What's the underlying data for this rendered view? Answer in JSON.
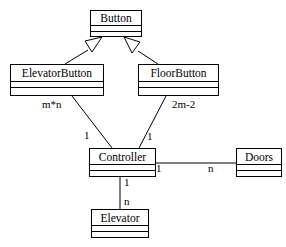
{
  "diagram": {
    "type": "uml-class-diagram",
    "canvas": {
      "width": 286,
      "height": 247
    },
    "colors": {
      "background": "#ffffff",
      "line": "#000000",
      "text": "#000000",
      "fill": "#ffffff"
    },
    "classes": [
      {
        "id": "button",
        "name": "Button",
        "compartments": 3
      },
      {
        "id": "elevatorbutton",
        "name": "ElevatorButton",
        "compartments": 3
      },
      {
        "id": "floorbutton",
        "name": "FloorButton",
        "compartments": 3
      },
      {
        "id": "controller",
        "name": "Controller",
        "compartments": 3
      },
      {
        "id": "doors",
        "name": "Doors",
        "compartments": 3
      },
      {
        "id": "elevator",
        "name": "Elevator",
        "compartments": 3
      }
    ],
    "generalizations": [
      {
        "from": "ElevatorButton",
        "to": "Button",
        "arrow": "hollow-triangle"
      },
      {
        "from": "FloorButton",
        "to": "Button",
        "arrow": "hollow-triangle"
      }
    ],
    "associations": [
      {
        "from": "ElevatorButton",
        "to": "Controller",
        "from_multiplicity": "m*n",
        "to_multiplicity": "1"
      },
      {
        "from": "FloorButton",
        "to": "Controller",
        "from_multiplicity": "2m-2",
        "to_multiplicity": "1"
      },
      {
        "from": "Controller",
        "to": "Doors",
        "from_multiplicity": "1",
        "to_multiplicity": "n"
      },
      {
        "from": "Controller",
        "to": "Elevator",
        "from_multiplicity": "1",
        "to_multiplicity": "n"
      }
    ],
    "multiplicity_labels": {
      "elevatorbutton_count": "m*n",
      "floorbutton_count": "2m-2",
      "elevatorbutton_controller_end": "1",
      "floorbutton_controller_end": "1",
      "controller_doors_near": "1",
      "controller_doors_far": "n",
      "controller_elevator_near": "1",
      "controller_elevator_far": "n"
    }
  }
}
